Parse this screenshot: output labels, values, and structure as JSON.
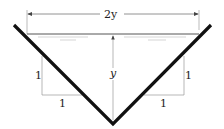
{
  "diagram": {
    "type": "triangular-channel-cross-section",
    "labels": {
      "top_width": "2y",
      "depth": "y",
      "left_slope_rise": "1",
      "left_slope_run": "1",
      "right_slope_rise": "1",
      "right_slope_run": "1"
    },
    "colors": {
      "channel_wall": "#111111",
      "dimension_line": "#888888",
      "water_surface": "#555555"
    }
  }
}
